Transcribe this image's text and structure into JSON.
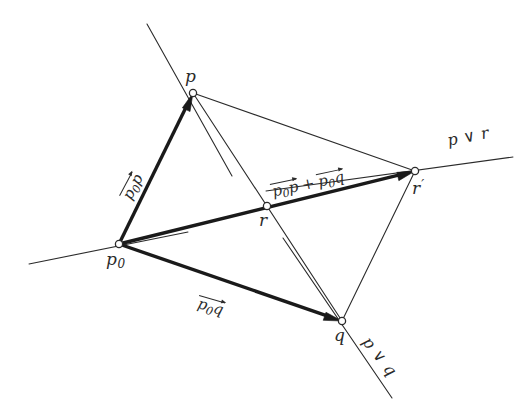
{
  "figure": {
    "type": "geometry-diagram",
    "background_color": "#ffffff",
    "ink_color": "#2b2b2b"
  },
  "points": [
    {
      "id": "p",
      "label": "p",
      "sub": "",
      "prime": "",
      "x": 193,
      "y": 93,
      "label_x": 185,
      "label_y": 66
    },
    {
      "id": "p0",
      "label": "p",
      "sub": "0",
      "prime": "",
      "x": 119,
      "y": 244,
      "label_x": 106,
      "label_y": 249
    },
    {
      "id": "r",
      "label": "r",
      "sub": "",
      "prime": "",
      "x": 267,
      "y": 206,
      "label_x": 259,
      "label_y": 210
    },
    {
      "id": "rp",
      "label": "r",
      "sub": "",
      "prime": "′",
      "x": 415,
      "y": 171,
      "label_x": 412,
      "label_y": 178
    },
    {
      "id": "q",
      "label": "q",
      "sub": "",
      "prime": "",
      "x": 342,
      "y": 321,
      "label_x": 334,
      "label_y": 325
    }
  ],
  "lines": [
    {
      "id": "line-p0-p-extended",
      "name": "line through p0 and p",
      "x1": 147,
      "y1": 24,
      "x2": 232,
      "y2": 176,
      "width": 1.1
    },
    {
      "id": "line-p-vee-r",
      "name": "line p join r",
      "x1": 266,
      "y1": 191,
      "x2": 513,
      "y2": 157,
      "width": 1.1
    },
    {
      "id": "line-p-vee-q",
      "name": "line p join q",
      "x1": 283,
      "y1": 238,
      "x2": 392,
      "y2": 398,
      "width": 1.1
    },
    {
      "id": "line-p0-axis",
      "name": "horizontal axis through p0",
      "x1": 29,
      "y1": 264,
      "x2": 188,
      "y2": 232,
      "width": 1.1
    },
    {
      "id": "chord-p-rp",
      "name": "segment p to r prime",
      "x1": 193,
      "y1": 93,
      "x2": 415,
      "y2": 171,
      "width": 1.1
    },
    {
      "id": "chord-p-q",
      "name": "segment p to q through r",
      "x1": 193,
      "y1": 93,
      "x2": 342,
      "y2": 321,
      "width": 1.1
    },
    {
      "id": "chord-q-rp",
      "name": "segment q to r prime",
      "x1": 342,
      "y1": 321,
      "x2": 415,
      "y2": 171,
      "width": 1.1
    }
  ],
  "vectors": [
    {
      "id": "vec-p0p",
      "name": "vector p0 to p",
      "from": "p0",
      "to": "p",
      "x1": 119,
      "y1": 244,
      "x2": 193,
      "y2": 93,
      "label_text": "p0p",
      "label_x": 120,
      "label_y": 196,
      "rotation_class": "rot-pop"
    },
    {
      "id": "vec-p0q",
      "name": "vector p0 to q",
      "from": "p0",
      "to": "q",
      "x1": 119,
      "y1": 244,
      "x2": 342,
      "y2": 321,
      "label_text": "p0q",
      "label_x": 199,
      "label_y": 296,
      "rotation_class": "rot-poq"
    },
    {
      "id": "vec-sum",
      "name": "vector p0 to r prime (sum)",
      "from": "p0",
      "to": "rp",
      "x1": 119,
      "y1": 244,
      "x2": 415,
      "y2": 171,
      "label_text": "p0p + p0q",
      "label_x": 270,
      "label_y": 185,
      "rotation_class": "rot-sum"
    }
  ],
  "vector_labels": {
    "p0p": {
      "head": "p",
      "sub": "0",
      "tail": "p"
    },
    "p0q": {
      "head": "p",
      "sub": "0",
      "tail": "q"
    },
    "plus": "+"
  },
  "line_labels": [
    {
      "id": "label-p-vee-r",
      "text": "p ∨ r",
      "x": 446,
      "y": 133,
      "rotation_class": "rot-pvr"
    },
    {
      "id": "label-p-vee-q",
      "text": "p ∨ q",
      "x": 372,
      "y": 334,
      "rotation_class": "rot-pvq"
    }
  ],
  "node_style": {
    "radius": 3.6,
    "fill": "#ffffff",
    "stroke": "#2b2b2b",
    "stroke_width": 1.3
  },
  "arrow_style": {
    "shaft_width": 3.4,
    "head_length": 18,
    "head_width": 11,
    "color": "#1a1a1a"
  }
}
